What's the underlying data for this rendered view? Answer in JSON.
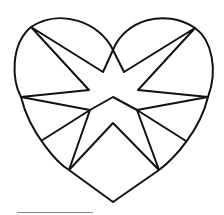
{
  "figure": {
    "stroke_color": "#111111",
    "background": "#ffffff",
    "caption_line_color": "#8a8a8a"
  }
}
